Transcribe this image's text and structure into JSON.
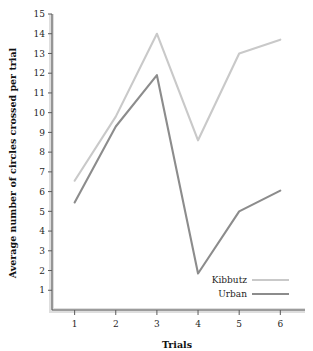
{
  "chart_data": {
    "type": "line",
    "title": "",
    "xlabel": "Trials",
    "ylabel": "Average number of circles crossed per trial",
    "categories": [
      "1",
      "2",
      "3",
      "4",
      "5",
      "6"
    ],
    "x": [
      1,
      2,
      3,
      4,
      5,
      6
    ],
    "xlim": [
      0.45,
      6.6
    ],
    "ylim": [
      0,
      15
    ],
    "ytick_labels": [
      "1",
      "2",
      "3",
      "4",
      "5",
      "6",
      "7",
      "8",
      "9",
      "10",
      "11",
      "12",
      "13",
      "14",
      "15"
    ],
    "yticks": [
      1,
      2,
      3,
      4,
      5,
      6,
      7,
      8,
      9,
      10,
      11,
      12,
      13,
      14,
      15
    ],
    "xtick_labels": [
      "1",
      "2",
      "3",
      "4",
      "5",
      "6"
    ],
    "grid": false,
    "legend_position": "bottom-right",
    "series": [
      {
        "name": "Kibbutz",
        "color": "#c9c9c9",
        "values": [
          6.55,
          9.8,
          14.0,
          8.6,
          13.0,
          13.7
        ]
      },
      {
        "name": "Urban",
        "color": "#8c8c8c",
        "values": [
          5.45,
          9.3,
          11.9,
          1.85,
          5.0,
          6.05
        ]
      }
    ]
  },
  "legend": {
    "entries": [
      {
        "label": "Kibbutz"
      },
      {
        "label": "Urban"
      }
    ]
  },
  "axes": {
    "x_title": "Trials",
    "y_title": "Average number of circles crossed per trial"
  }
}
